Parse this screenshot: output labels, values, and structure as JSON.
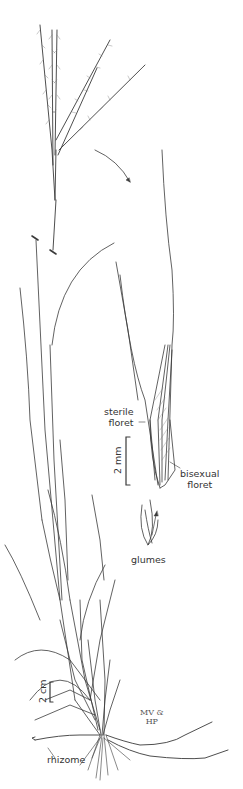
{
  "illustration": {
    "subject": "grass plant line drawing",
    "labels": {
      "sterile_floret_line1": "sterile",
      "sterile_floret_line2": "floret",
      "bisexual_floret_line1": "bisexual",
      "bisexual_floret_line2": "floret",
      "glumes": "glumes",
      "rhizome": "rhizome"
    },
    "scale_bars": {
      "spikelet": "2 mm",
      "plant": "2 cm"
    },
    "signature": {
      "line1": "MV &",
      "line2": "HP"
    },
    "colors": {
      "ink": "#3a3a3a",
      "background": "#ffffff"
    }
  }
}
